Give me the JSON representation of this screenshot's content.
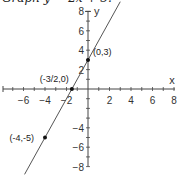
{
  "header": {
    "title": "Graph y = 2x + 3."
  },
  "chart_data": {
    "type": "line",
    "title": "Graph y = 2x + 3.",
    "xlabel": "x",
    "ylabel": "y",
    "xlim": [
      -8,
      8
    ],
    "ylim": [
      -8,
      8
    ],
    "x_ticks": [
      -6,
      -4,
      -2,
      2,
      4,
      6,
      8
    ],
    "y_ticks": [
      8,
      6,
      4,
      2,
      -4,
      -6,
      -8
    ],
    "grid": false,
    "series": [
      {
        "name": "y = 2x + 3",
        "slope": 2,
        "intercept": 3,
        "x_range": [
          -5.9,
          3
        ]
      }
    ],
    "points": [
      {
        "x": 0,
        "y": 3,
        "label": "(0,3)"
      },
      {
        "x": -1.5,
        "y": 0,
        "label": "(-3/2,0)"
      },
      {
        "x": -4,
        "y": -5,
        "label": "(-4,-5)"
      }
    ]
  },
  "colors": {
    "line": "#555555",
    "axis": "#444444",
    "point": "#111111"
  }
}
